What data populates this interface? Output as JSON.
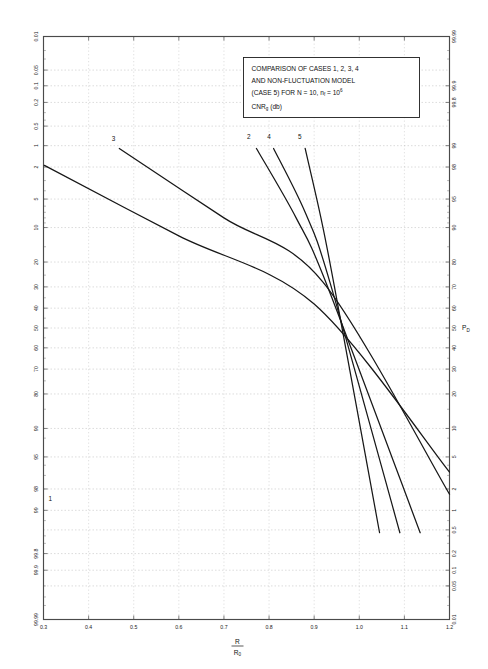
{
  "chart_data": {
    "type": "line",
    "title": "",
    "annotation_box": {
      "line1": "COMPARISON OF CASES 1, 2, 3, 4",
      "line2": "AND NON-FLUCTUATION MODEL",
      "line3_a": "(CASE 5) FOR N = 10, n",
      "line3_sub": "f",
      "line3_b": " = 10",
      "line3_exp": "6",
      "line4_a": "CNR",
      "line4_sub": "g",
      "line4_b": " (db)"
    },
    "xlabel_numerator": "R",
    "xlabel_denominator": "R",
    "xlabel_denominator_sub": "0",
    "ylabel_right": "P",
    "ylabel_right_sub": "D",
    "xlim": [
      0.3,
      1.2
    ],
    "xticks": [
      0.3,
      0.4,
      0.5,
      0.6,
      0.7,
      0.8,
      0.9,
      1.0,
      1.1,
      1.2
    ],
    "xticklabels": [
      "0.3",
      "0.4",
      "0.5",
      "0.6",
      "0.7",
      "0.8",
      "0.9",
      "1.0",
      "1.1",
      "1.2"
    ],
    "yscale": "normal-probability",
    "ylim_percent": [
      0.01,
      99.99
    ],
    "y_axis_left_label": "",
    "left_ticks_percent": [
      0.01,
      0.05,
      0.1,
      0.2,
      0.5,
      1,
      2,
      5,
      10,
      20,
      30,
      40,
      50,
      60,
      70,
      80,
      90,
      95,
      98,
      99,
      99.8,
      99.9,
      99.99
    ],
    "left_ticklabels": [
      "0.01",
      "0.05",
      "0.1",
      "0.2",
      "0.5",
      "1",
      "2",
      "5",
      "10",
      "20",
      "30",
      "40",
      "50",
      "60",
      "70",
      "80",
      "90",
      "95",
      "98",
      "99",
      "99.8",
      "99.9",
      "99.99"
    ],
    "right_ticks_percent": [
      99.99,
      99.9,
      99.8,
      99,
      98,
      95,
      90,
      80,
      70,
      60,
      50,
      40,
      30,
      20,
      10,
      5,
      2,
      1,
      0.5,
      0.2,
      0.1,
      0.05,
      0.01
    ],
    "right_ticklabels": [
      "99.99",
      "99.9",
      "99.8",
      "99",
      "98",
      "95",
      "90",
      "80",
      "70",
      "60",
      "50",
      "40",
      "30",
      "20",
      "10",
      "5",
      "2",
      "1",
      "0.5",
      "0.2",
      "0.1",
      "0.05",
      "0.01"
    ],
    "grid": true,
    "legend_position": "none",
    "series": [
      {
        "name": "1",
        "label": "1",
        "label_x": 0.315,
        "label_y_percent": 1.35,
        "points": [
          {
            "x": 0.302,
            "pd_percent": 98.1
          },
          {
            "x": 0.6,
            "pd_percent": 88.0
          },
          {
            "x": 0.9,
            "pd_percent": 62.0
          },
          {
            "x": 1.2,
            "pd_percent": 3.3
          }
        ]
      },
      {
        "name": "3",
        "label": "3",
        "label_x": 0.455,
        "label_y_percent": 99.15,
        "points": [
          {
            "x": 0.468,
            "pd_percent": 98.9
          },
          {
            "x": 0.7,
            "pd_percent": 92.0
          },
          {
            "x": 0.92,
            "pd_percent": 72.0
          },
          {
            "x": 1.2,
            "pd_percent": 1.7
          }
        ]
      },
      {
        "name": "2",
        "label": "2",
        "label_x": 0.755,
        "label_y_percent": 99.2,
        "points": [
          {
            "x": 0.772,
            "pd_percent": 98.9
          },
          {
            "x": 0.86,
            "pd_percent": 92.0
          },
          {
            "x": 0.93,
            "pd_percent": 70.0
          },
          {
            "x": 1.135,
            "pd_percent": 0.45
          }
        ]
      },
      {
        "name": "4",
        "label": "4",
        "label_x": 0.8,
        "label_y_percent": 99.2,
        "points": [
          {
            "x": 0.81,
            "pd_percent": 98.9
          },
          {
            "x": 0.88,
            "pd_percent": 93.0
          },
          {
            "x": 0.935,
            "pd_percent": 72.0
          },
          {
            "x": 1.09,
            "pd_percent": 0.45
          }
        ]
      },
      {
        "name": "5",
        "label": "5",
        "label_x": 0.868,
        "label_y_percent": 99.2,
        "points": [
          {
            "x": 0.88,
            "pd_percent": 98.9
          },
          {
            "x": 0.915,
            "pd_percent": 92.0
          },
          {
            "x": 0.945,
            "pd_percent": 70.0
          },
          {
            "x": 1.045,
            "pd_percent": 0.45
          }
        ]
      }
    ]
  }
}
